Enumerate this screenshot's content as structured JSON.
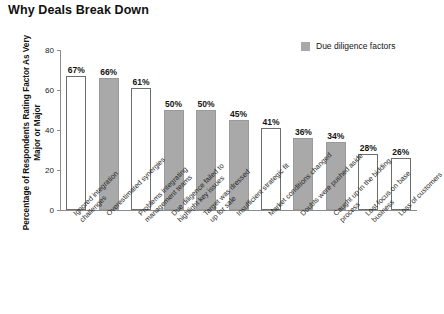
{
  "chart_data": {
    "type": "bar",
    "title": "Why Deals Break Down",
    "xlabel": "",
    "ylabel": "Percentage of Respondents Rating Factor As Very Major or Major",
    "ylim": [
      0,
      80
    ],
    "yticks": [
      0,
      20,
      40,
      60,
      80
    ],
    "grid": false,
    "legend": {
      "position": "top-right",
      "entries": [
        {
          "label": "Due diligence factors",
          "color": "#a9a9a9"
        }
      ]
    },
    "value_suffix": "%",
    "categories": [
      "Ignored integration challenges",
      "Overestimated synergies",
      "Problems integrating management teams",
      "Due diligence failed to highlight key issues",
      "Target was dressed up for sale",
      "Insufficient strategic fit",
      "Market conditions changed",
      "Doubts were pushed aside",
      "Caught up in the bidding process",
      "Lost focus on base business",
      "Loss of customers"
    ],
    "values": [
      67,
      66,
      61,
      50,
      50,
      45,
      41,
      36,
      34,
      28,
      26
    ],
    "value_labels": [
      "67%",
      "66%",
      "61%",
      "50%",
      "50%",
      "45%",
      "41%",
      "36%",
      "34%",
      "28%",
      "26%"
    ],
    "bar_styles": [
      "hollow",
      "filled",
      "hollow",
      "filled",
      "filled",
      "filled",
      "hollow",
      "filled",
      "filled",
      "hollow",
      "hollow"
    ],
    "points": [
      {
        "category": "Ignored integration challenges",
        "label_line1": "Ignored integration",
        "label_line2": "challenges",
        "value": 67,
        "value_label": "67%",
        "style": "hollow",
        "due_diligence_factor": false
      },
      {
        "category": "Overestimated synergies",
        "label_line1": "Overestimated synergies",
        "label_line2": "",
        "value": 66,
        "value_label": "66%",
        "style": "filled",
        "due_diligence_factor": true
      },
      {
        "category": "Problems integrating management teams",
        "label_line1": "Problems integrating",
        "label_line2": "management teams",
        "value": 61,
        "value_label": "61%",
        "style": "hollow",
        "due_diligence_factor": false
      },
      {
        "category": "Due diligence failed to highlight key issues",
        "label_line1": "Due diligence failed to",
        "label_line2": "highlight key issues",
        "value": 50,
        "value_label": "50%",
        "style": "filled",
        "due_diligence_factor": true
      },
      {
        "category": "Target was dressed up for sale",
        "label_line1": "Target was dressed",
        "label_line2": "up for sale",
        "value": 50,
        "value_label": "50%",
        "style": "filled",
        "due_diligence_factor": true
      },
      {
        "category": "Insufficient strategic fit",
        "label_line1": "Insufficient strategic fit",
        "label_line2": "",
        "value": 45,
        "value_label": "45%",
        "style": "filled",
        "due_diligence_factor": true
      },
      {
        "category": "Market conditions changed",
        "label_line1": "Market conditions changed",
        "label_line2": "",
        "value": 41,
        "value_label": "41%",
        "style": "hollow",
        "due_diligence_factor": false
      },
      {
        "category": "Doubts were pushed aside",
        "label_line1": "Doubts were pushed aside",
        "label_line2": "",
        "value": 36,
        "value_label": "36%",
        "style": "filled",
        "due_diligence_factor": true
      },
      {
        "category": "Caught up in the bidding process",
        "label_line1": "Caught up in the bidding",
        "label_line2": "process",
        "value": 34,
        "value_label": "34%",
        "style": "filled",
        "due_diligence_factor": true
      },
      {
        "category": "Lost focus on base business",
        "label_line1": "Lost focus on base",
        "label_line2": "business",
        "value": 28,
        "value_label": "28%",
        "style": "hollow",
        "due_diligence_factor": false
      },
      {
        "category": "Loss of customers",
        "label_line1": "Loss of customers",
        "label_line2": "",
        "value": 26,
        "value_label": "26%",
        "style": "hollow",
        "due_diligence_factor": false
      }
    ]
  },
  "colors": {
    "filled_bar": "#a9a9a9",
    "hollow_bar": "#ffffff",
    "bar_outline": "#6e6e6e",
    "axis": "#8c8c8c",
    "text": "#1a1a1a",
    "background": "#ffffff"
  }
}
